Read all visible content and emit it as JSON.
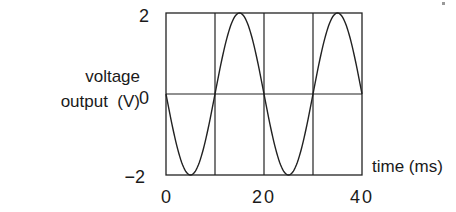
{
  "chart_data": {
    "type": "line",
    "title": "",
    "xlabel": "time (ms)",
    "ylabel": "voltage output (V)",
    "ylabel_lines": [
      "voltage",
      "output  (V)"
    ],
    "xlim": [
      0,
      40
    ],
    "ylim": [
      -2,
      2
    ],
    "x_ticks": [
      0,
      20,
      40
    ],
    "x_tick_labels": [
      "0",
      "20",
      "40"
    ],
    "y_ticks": [
      2,
      0,
      -2
    ],
    "y_tick_labels": [
      "2",
      "0",
      "−2"
    ],
    "grid": {
      "vertical_lines_at": [
        10,
        20,
        30
      ],
      "horizontal_lines_at": [
        0
      ]
    },
    "legend": null,
    "series": [
      {
        "name": "voltage",
        "function": "-2*sin(2*pi*t/20)",
        "amplitude": 2,
        "period_ms": 20,
        "x": [
          0,
          2.5,
          5,
          7.5,
          10,
          12.5,
          15,
          17.5,
          20,
          22.5,
          25,
          27.5,
          30,
          32.5,
          35,
          37.5,
          40
        ],
        "values": [
          0,
          -1.41,
          -2,
          -1.41,
          0,
          1.41,
          2,
          1.41,
          0,
          -1.41,
          -2,
          -1.41,
          0,
          1.41,
          2,
          1.41,
          0
        ]
      }
    ],
    "colors": {
      "line": "#222222",
      "background": "#ffffff"
    }
  }
}
